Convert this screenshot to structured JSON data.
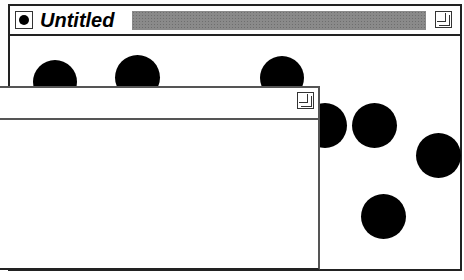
{
  "back_window": {
    "title": "Untitled",
    "close_box_icon": "close-box-icon",
    "zoom_box_icon": "zoom-box-icon",
    "title_fill_color": "#8a8a8a",
    "content_shapes": [
      {
        "type": "circle",
        "cx": 55,
        "cy": 84,
        "r": 22
      },
      {
        "type": "circle",
        "cx": 137,
        "cy": 78,
        "r": 22
      },
      {
        "type": "circle",
        "cx": 282,
        "cy": 78,
        "r": 22
      },
      {
        "type": "circle",
        "cx": 325,
        "cy": 125,
        "r": 22
      },
      {
        "type": "circle",
        "cx": 374,
        "cy": 126,
        "r": 22
      },
      {
        "type": "circle",
        "cx": 438,
        "cy": 156,
        "r": 22
      },
      {
        "type": "circle",
        "cx": 383,
        "cy": 216,
        "r": 22
      }
    ]
  },
  "front_window": {
    "title": "",
    "zoom_box_icon": "zoom-box-icon"
  }
}
